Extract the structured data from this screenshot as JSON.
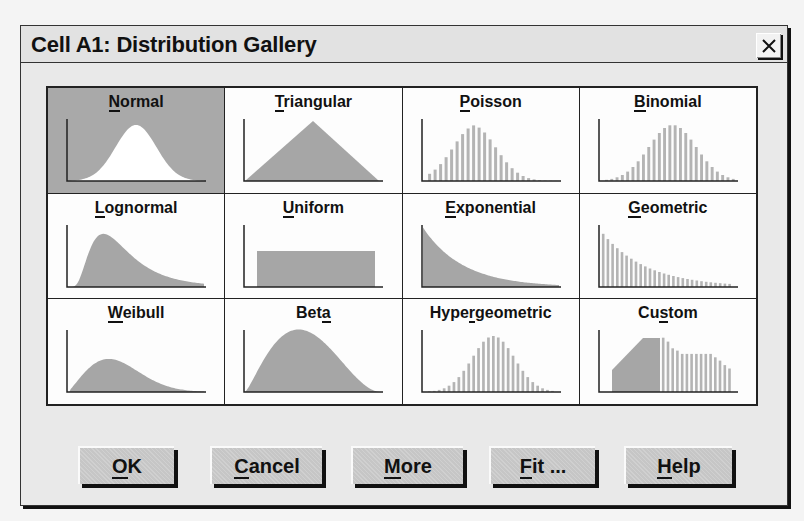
{
  "dialog": {
    "title": "Cell A1: Distribution Gallery",
    "close_icon": "close-x-icon"
  },
  "gallery": {
    "selected": "Normal",
    "items": [
      {
        "label": "Normal",
        "mnemonic_index": 0,
        "type": "continuous",
        "shape": "normal"
      },
      {
        "label": "Triangular",
        "mnemonic_index": 0,
        "type": "continuous",
        "shape": "triangular"
      },
      {
        "label": "Poisson",
        "mnemonic_index": 0,
        "type": "discrete",
        "shape": "poisson"
      },
      {
        "label": "Binomial",
        "mnemonic_index": 0,
        "type": "discrete",
        "shape": "binomial"
      },
      {
        "label": "Lognormal",
        "mnemonic_index": 0,
        "type": "continuous",
        "shape": "lognormal"
      },
      {
        "label": "Uniform",
        "mnemonic_index": 0,
        "type": "continuous",
        "shape": "uniform"
      },
      {
        "label": "Exponential",
        "mnemonic_index": 0,
        "type": "continuous",
        "shape": "exponential"
      },
      {
        "label": "Geometric",
        "mnemonic_index": 0,
        "type": "discrete",
        "shape": "geometric"
      },
      {
        "label": "Weibull",
        "mnemonic_index": 0,
        "type": "continuous",
        "shape": "weibull"
      },
      {
        "label": "Beta",
        "mnemonic_index": 3,
        "type": "continuous",
        "shape": "beta"
      },
      {
        "label": "Hypergeometric",
        "mnemonic_index": 4,
        "type": "discrete",
        "shape": "hypergeometric"
      },
      {
        "label": "Custom",
        "mnemonic_index": 2,
        "type": "mixed",
        "shape": "custom"
      }
    ]
  },
  "buttons": [
    {
      "label": "OK",
      "mnemonic_index": 0
    },
    {
      "label": "Cancel",
      "mnemonic_index": 0
    },
    {
      "label": "More",
      "mnemonic_index": 0
    },
    {
      "label": "Fit ...",
      "mnemonic_index": 0
    },
    {
      "label": "Help",
      "mnemonic_index": 0
    }
  ],
  "colors": {
    "dialog_bg": "#e9e9e9",
    "cell_bg": "#fdfdfd",
    "selected_bg": "#a9a9a9",
    "plot_fill": "#a6a6a6",
    "bar_fill": "#b4b4b4",
    "axis": "#222222"
  }
}
